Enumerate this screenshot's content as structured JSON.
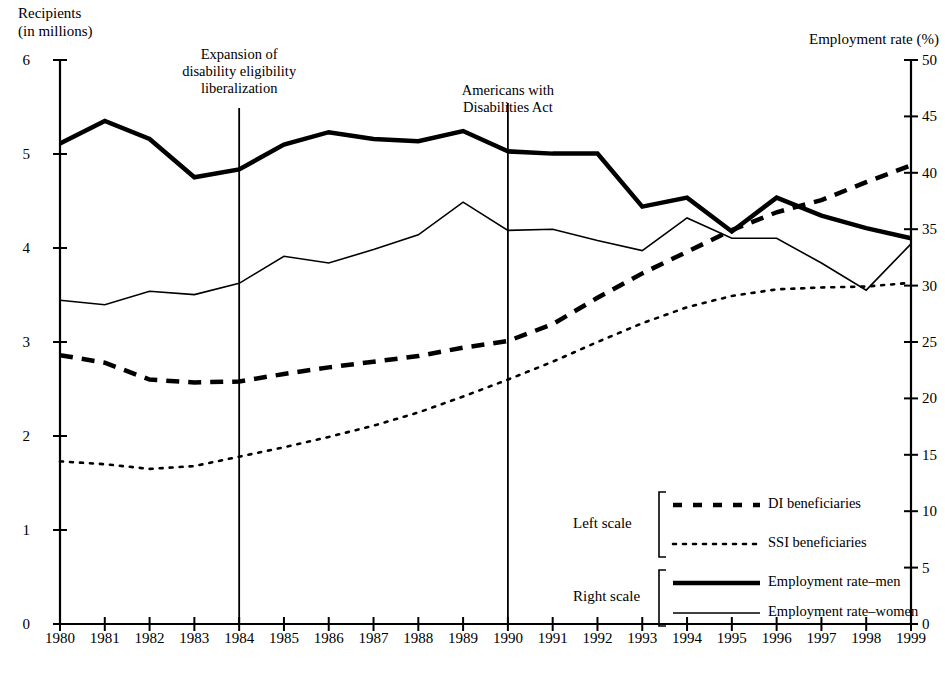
{
  "axis_titles": {
    "left": "Recipients\n(in millions)",
    "right": "Employment rate (%)"
  },
  "annotations": [
    {
      "text": "Expansion of\ndisability eligibility\nliberalization",
      "year": 1984
    },
    {
      "text": "Americans with\nDisabilities Act",
      "year": 1990
    }
  ],
  "legend": {
    "groups": [
      {
        "scale_label": "Left scale",
        "entries": [
          "DI beneficiaries",
          "SSI beneficiaries"
        ]
      },
      {
        "scale_label": "Right scale",
        "entries": [
          "Employment rate–men",
          "Employment rate–women"
        ]
      }
    ]
  },
  "chart_data": {
    "type": "line",
    "title": "",
    "xlabel": "",
    "ylabel": "Recipients (in millions)",
    "y2label": "Employment rate (%)",
    "grid": false,
    "legend_position": "bottom-right",
    "x": [
      1980,
      1981,
      1982,
      1983,
      1984,
      1985,
      1986,
      1987,
      1988,
      1989,
      1990,
      1991,
      1992,
      1993,
      1994,
      1995,
      1996,
      1997,
      1998,
      1999
    ],
    "xlim": [
      1980,
      1999
    ],
    "ylim": [
      0,
      6
    ],
    "y2lim": [
      0,
      50
    ],
    "yticks": [
      0,
      1,
      2,
      3,
      4,
      5,
      6
    ],
    "y2ticks": [
      0,
      5,
      10,
      15,
      20,
      25,
      30,
      35,
      40,
      45,
      50
    ],
    "xtick_labels": [
      "1980",
      "1981",
      "1982",
      "1983",
      "1984",
      "1985",
      "1986",
      "1987",
      "1988",
      "1989",
      "1990",
      "1991",
      "1992",
      "1993",
      "1994",
      "1995",
      "1996",
      "1997",
      "1998",
      "1999"
    ],
    "ytick_labels": [
      "0",
      "1",
      "2",
      "3",
      "4",
      "5",
      "6"
    ],
    "y2tick_labels": [
      "0",
      "5",
      "10",
      "15",
      "20",
      "25",
      "30",
      "35",
      "40",
      "45",
      "50"
    ],
    "series": [
      {
        "name": "DI beneficiaries",
        "axis": "left",
        "style": "dashed",
        "width": 4.5,
        "color": "#000000",
        "values": [
          2.86,
          2.78,
          2.6,
          2.57,
          2.58,
          2.66,
          2.73,
          2.79,
          2.85,
          2.94,
          3.01,
          3.19,
          3.47,
          3.73,
          3.96,
          4.19,
          4.38,
          4.51,
          4.7,
          4.88
        ]
      },
      {
        "name": "SSI beneficiaries",
        "axis": "left",
        "style": "dotted",
        "width": 2.6,
        "color": "#000000",
        "values": [
          1.73,
          1.7,
          1.65,
          1.68,
          1.78,
          1.88,
          1.99,
          2.11,
          2.25,
          2.42,
          2.6,
          2.79,
          3.0,
          3.2,
          3.37,
          3.49,
          3.56,
          3.58,
          3.59,
          3.63
        ]
      },
      {
        "name": "Employment rate–men",
        "axis": "right",
        "style": "solid",
        "width": 4.5,
        "color": "#000000",
        "values": [
          42.6,
          44.6,
          43.0,
          39.6,
          40.3,
          42.5,
          43.6,
          43.0,
          42.8,
          43.7,
          41.9,
          41.7,
          41.7,
          37.0,
          37.8,
          34.8,
          37.8,
          36.2,
          35.1,
          34.2
        ]
      },
      {
        "name": "Employment rate–women",
        "axis": "right",
        "style": "solid",
        "width": 1.6,
        "color": "#000000",
        "values": [
          28.7,
          28.3,
          29.5,
          29.2,
          30.2,
          32.6,
          32.0,
          33.2,
          34.5,
          37.4,
          34.9,
          35.0,
          34.0,
          33.1,
          36.0,
          34.2,
          34.2,
          32.0,
          29.6,
          33.7
        ]
      }
    ],
    "vertical_markers": [
      {
        "year": 1984,
        "label": "Expansion of disability eligibility liberalization"
      },
      {
        "year": 1990,
        "label": "Americans with Disabilities Act"
      }
    ]
  }
}
